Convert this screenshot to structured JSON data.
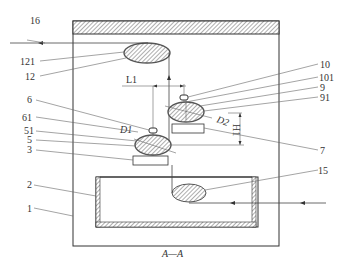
{
  "diagram": {
    "title": "A—A",
    "colors": {
      "line": "#333333",
      "hatch": "#777777",
      "background": "#ffffff"
    },
    "labels": {
      "l16": "16",
      "l121": "121",
      "l12": "12",
      "l6": "6",
      "l61": "61",
      "l51": "51",
      "l5": "5",
      "l3": "3",
      "l2": "2",
      "l1": "1",
      "l10": "10",
      "l101": "101",
      "l9": "9",
      "l91": "91",
      "l7": "7",
      "l15": "15"
    },
    "dimensions": {
      "L1": "L1",
      "D1": "D1",
      "D2": "D2",
      "H1": "H1"
    }
  }
}
